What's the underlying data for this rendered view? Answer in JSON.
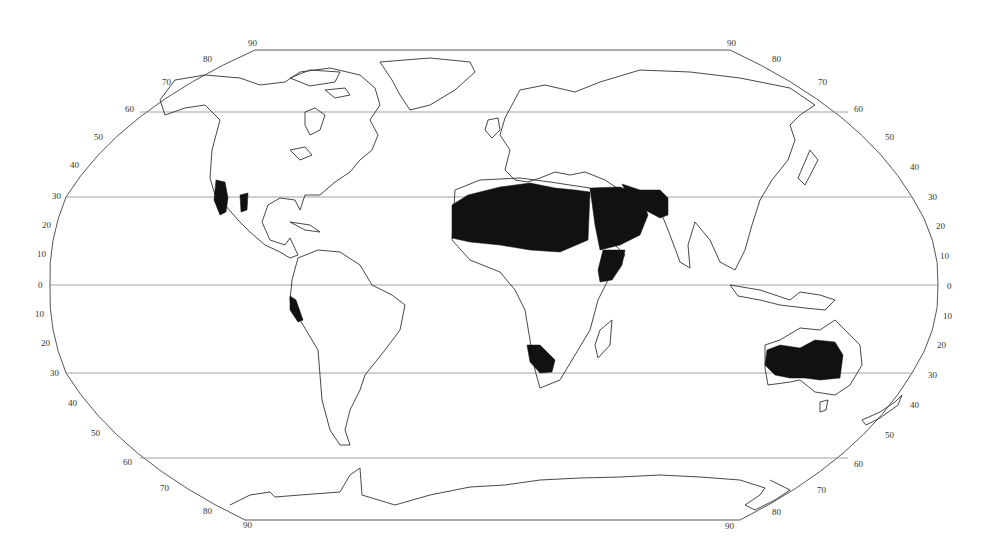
{
  "map": {
    "projection": "Robinson-style world map",
    "style": {
      "background": "#ffffff",
      "coastline_color": "#333333",
      "graticule_color": "#8a8a8a",
      "shaded_region_color": "#111111"
    },
    "parallels_drawn": [
      "60N",
      "30N",
      "0",
      "30S",
      "60S"
    ],
    "latitude_labels": {
      "left_north": [
        "90",
        "80",
        "70",
        "60",
        "50",
        "40",
        "30",
        "20",
        "10"
      ],
      "equator_left": "0",
      "left_south": [
        "10",
        "20",
        "30",
        "40",
        "50",
        "60",
        "70",
        "80",
        "90"
      ],
      "right_north": [
        "90",
        "80",
        "70",
        "60",
        "50",
        "40",
        "30",
        "20",
        "10"
      ],
      "equator_right": "0",
      "right_south": [
        "10",
        "20",
        "30",
        "40",
        "50",
        "60",
        "70",
        "80",
        "90"
      ]
    },
    "shaded_regions": [
      "Sahara Desert",
      "Arabian Desert",
      "Iranian / Thar Desert",
      "Somali / Horn of Africa",
      "Kalahari / Namib",
      "Australian Deserts",
      "Sonoran / Mojave / Chihuahuan",
      "Atacama / Peruvian coast"
    ]
  }
}
